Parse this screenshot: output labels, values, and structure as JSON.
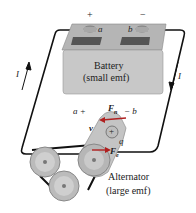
{
  "battery": {
    "title": "Battery",
    "subtitle": "(small emf)",
    "plus_sign": "+",
    "minus_sign": "−",
    "terminal_a": "a",
    "terminal_b": "b"
  },
  "circuit": {
    "current_left": "I",
    "current_right": "I"
  },
  "alternator": {
    "title": "Alternator",
    "subtitle": "(large emf)",
    "label_a": "a +",
    "label_b": "− b",
    "force_n": "F",
    "force_n_sub": "n",
    "force_e": "F",
    "force_e_sub": "e",
    "velocity": "v",
    "charge": "q",
    "charge_sign": "+"
  },
  "colors": {
    "battery_top": "#b8b8b8",
    "battery_body": "#c9c9c9",
    "wire": "#111111",
    "arrow_red": "#b02020"
  }
}
